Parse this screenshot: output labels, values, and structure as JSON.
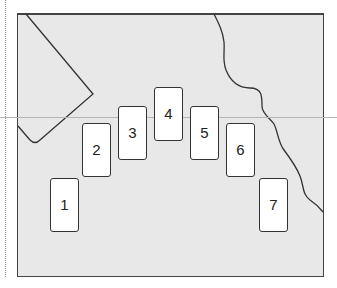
{
  "diagram": {
    "type": "card-spread-layout",
    "background_color": "#e8e8e8",
    "line_color": "#333333",
    "cards": [
      {
        "label": "1",
        "x": 50,
        "y": 178
      },
      {
        "label": "2",
        "x": 82,
        "y": 123
      },
      {
        "label": "3",
        "x": 118,
        "y": 106
      },
      {
        "label": "4",
        "x": 154,
        "y": 87
      },
      {
        "label": "5",
        "x": 190,
        "y": 106
      },
      {
        "label": "6",
        "x": 226,
        "y": 123
      },
      {
        "label": "7",
        "x": 259,
        "y": 178
      }
    ]
  }
}
